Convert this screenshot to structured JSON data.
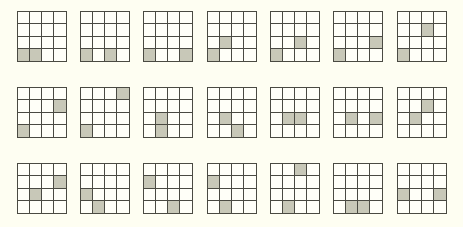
{
  "figure": {
    "grid_size": 4,
    "colors": {
      "background": "#fefef2",
      "line": "#4a4a42",
      "shaded": "#c8c8b8"
    },
    "columns_x": [
      17,
      80,
      143,
      207,
      270,
      333,
      397
    ],
    "rows_y": [
      11,
      87,
      163
    ],
    "rows": [
      {
        "grids": [
          {
            "shaded": [
              [
                3,
                0
              ],
              [
                3,
                1
              ]
            ]
          },
          {
            "shaded": [
              [
                3,
                0
              ],
              [
                3,
                2
              ]
            ]
          },
          {
            "shaded": [
              [
                3,
                0
              ],
              [
                3,
                3
              ]
            ]
          },
          {
            "shaded": [
              [
                2,
                1
              ],
              [
                3,
                0
              ]
            ]
          },
          {
            "shaded": [
              [
                2,
                2
              ],
              [
                3,
                0
              ]
            ]
          },
          {
            "shaded": [
              [
                2,
                3
              ],
              [
                3,
                0
              ]
            ]
          },
          {
            "shaded": [
              [
                1,
                2
              ],
              [
                3,
                0
              ]
            ]
          }
        ]
      },
      {
        "grids": [
          {
            "shaded": [
              [
                1,
                3
              ],
              [
                3,
                0
              ]
            ]
          },
          {
            "shaded": [
              [
                0,
                3
              ],
              [
                3,
                0
              ]
            ]
          },
          {
            "shaded": [
              [
                2,
                1
              ],
              [
                3,
                1
              ]
            ]
          },
          {
            "shaded": [
              [
                2,
                1
              ],
              [
                3,
                2
              ]
            ]
          },
          {
            "shaded": [
              [
                2,
                1
              ],
              [
                2,
                2
              ]
            ]
          },
          {
            "shaded": [
              [
                2,
                1
              ],
              [
                2,
                3
              ]
            ]
          },
          {
            "shaded": [
              [
                1,
                2
              ],
              [
                2,
                1
              ]
            ]
          }
        ]
      },
      {
        "grids": [
          {
            "shaded": [
              [
                1,
                3
              ],
              [
                2,
                1
              ]
            ]
          },
          {
            "shaded": [
              [
                2,
                0
              ],
              [
                3,
                1
              ]
            ]
          },
          {
            "shaded": [
              [
                1,
                0
              ],
              [
                3,
                2
              ]
            ]
          },
          {
            "shaded": [
              [
                1,
                0
              ],
              [
                3,
                1
              ]
            ]
          },
          {
            "shaded": [
              [
                0,
                2
              ],
              [
                3,
                1
              ]
            ]
          },
          {
            "shaded": [
              [
                3,
                1
              ],
              [
                3,
                2
              ]
            ]
          },
          {
            "shaded": [
              [
                2,
                0
              ],
              [
                2,
                3
              ]
            ]
          }
        ]
      }
    ]
  }
}
